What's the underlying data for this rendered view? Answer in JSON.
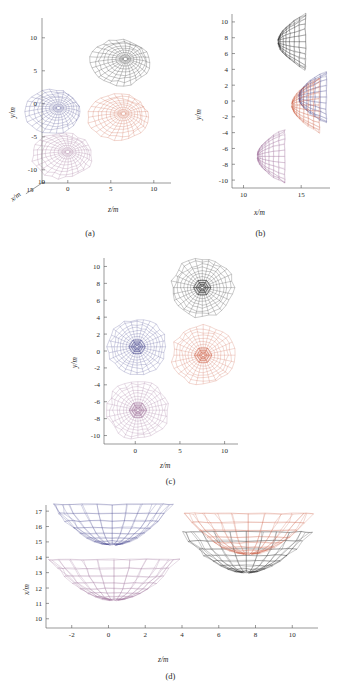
{
  "figure": {
    "type": "multi-panel-scientific-figure",
    "background": "#ffffff",
    "panels": [
      {
        "id": "a",
        "caption": "(a)",
        "projection": "3d-perspective"
      },
      {
        "id": "b",
        "caption": "(b)",
        "projection": "x-y side view"
      },
      {
        "id": "c",
        "caption": "(c)",
        "projection": "z-y top view"
      },
      {
        "id": "d",
        "caption": "(d)",
        "projection": "z-x front view"
      }
    ]
  },
  "colors": {
    "black": "#222222",
    "blue": "#4a4a8f",
    "orange": "#cd5f45",
    "purple": "#9a6a95",
    "axis": "#555555",
    "text": "#2a2a2a",
    "background": "#ffffff"
  },
  "clusters": [
    {
      "name": "cluster-black",
      "color": "#222222",
      "center": {
        "x": 13.0,
        "y": 7.5,
        "z": 7.5
      },
      "radius": 3.6
    },
    {
      "name": "cluster-blue",
      "color": "#4a4a8f",
      "center": {
        "x": 14.8,
        "y": 0.5,
        "z": 0.2
      },
      "radius": 3.4
    },
    {
      "name": "cluster-orange",
      "color": "#cd5f45",
      "center": {
        "x": 14.2,
        "y": -0.5,
        "z": 7.6
      },
      "radius": 3.6
    },
    {
      "name": "cluster-purple",
      "color": "#9a6a95",
      "center": {
        "x": 11.2,
        "y": -7.0,
        "z": 0.3
      },
      "radius": 3.6
    }
  ],
  "panel_a": {
    "caption": "(a)",
    "axes": {
      "y": {
        "label": "y/m",
        "ticks": [
          "10",
          "5",
          "0",
          "-5",
          "-10"
        ],
        "range": [
          -12,
          12
        ]
      },
      "z": {
        "label": "z/m",
        "ticks": [
          "0",
          "5",
          "10"
        ],
        "range": [
          -3,
          12
        ]
      },
      "x": {
        "label": "x/m",
        "ticks": [
          "15",
          "10"
        ],
        "range": [
          9,
          17
        ]
      }
    }
  },
  "panel_b": {
    "caption": "(b)",
    "axes": {
      "y": {
        "label": "y/m",
        "ticks": [
          "10",
          "8",
          "6",
          "4",
          "2",
          "0",
          "-2",
          "-4",
          "-6",
          "-8",
          "-10"
        ],
        "range": [
          -11,
          11
        ]
      },
      "x": {
        "label": "x/m",
        "ticks": [
          "10",
          "15"
        ],
        "range": [
          9,
          17.5
        ]
      }
    }
  },
  "panel_c": {
    "caption": "(c)",
    "axes": {
      "y": {
        "label": "y/m",
        "ticks": [
          "10",
          "8",
          "6",
          "4",
          "2",
          "0",
          "-2",
          "-4",
          "-6",
          "-8",
          "-10"
        ],
        "range": [
          -11,
          11
        ]
      },
      "z": {
        "label": "z/m",
        "ticks": [
          "0",
          "5",
          "10"
        ],
        "range": [
          -3.5,
          11.5
        ]
      }
    }
  },
  "panel_d": {
    "caption": "(d)",
    "axes": {
      "x": {
        "label": "x/m",
        "ticks": [
          "17",
          "16",
          "15",
          "14",
          "13",
          "12",
          "11",
          "10"
        ],
        "range": [
          9.4,
          17.4
        ]
      },
      "z": {
        "label": "z/m",
        "ticks": [
          "-2",
          "0",
          "2",
          "4",
          "6",
          "8",
          "10"
        ],
        "range": [
          -3.4,
          11.4
        ]
      }
    }
  },
  "chart_data": {
    "type": "scatter",
    "title": "",
    "series": [
      {
        "name": "cluster-black",
        "color": "#222222",
        "center_xyz": [
          13.0,
          7.5,
          7.5
        ],
        "radius": 3.6
      },
      {
        "name": "cluster-blue",
        "color": "#4a4a8f",
        "center_xyz": [
          14.8,
          0.5,
          0.2
        ],
        "radius": 3.4
      },
      {
        "name": "cluster-orange",
        "color": "#cd5f45",
        "center_xyz": [
          14.2,
          -0.5,
          7.6
        ],
        "radius": 3.6
      },
      {
        "name": "cluster-purple",
        "color": "#9a6a95",
        "center_xyz": [
          11.2,
          -7.0,
          0.3
        ],
        "radius": 3.6
      }
    ],
    "xlabel": "z/m",
    "ylabel": "y/m",
    "zlabel": "x/m",
    "grid": false,
    "legend": "none"
  }
}
